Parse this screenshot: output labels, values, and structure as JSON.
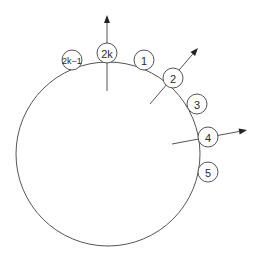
{
  "diagram": {
    "type": "ring-of-nodes",
    "ring": {
      "cx": 108,
      "cy": 154,
      "r": 92
    },
    "nodes": [
      {
        "id": "n2k1",
        "label": "2k−1",
        "cx": 72,
        "cy": 60,
        "r": 10,
        "font_size": 9
      },
      {
        "id": "n2k",
        "label": "2k",
        "cx": 107,
        "cy": 53,
        "r": 10,
        "font_size": 11
      },
      {
        "id": "n1",
        "label": "1",
        "cx": 144,
        "cy": 60,
        "r": 10,
        "font_size": 11
      },
      {
        "id": "n2",
        "label": "2",
        "cx": 173,
        "cy": 78,
        "r": 10,
        "font_size": 11
      },
      {
        "id": "n3",
        "label": "3",
        "cx": 197,
        "cy": 104,
        "r": 10,
        "font_size": 11
      },
      {
        "id": "n4",
        "label": "4",
        "cx": 208,
        "cy": 137,
        "r": 10,
        "font_size": 11
      },
      {
        "id": "n5",
        "label": "5",
        "cx": 208,
        "cy": 172,
        "r": 10,
        "font_size": 11
      }
    ],
    "arrows": [
      {
        "id": "arrow-2k",
        "from": [
          107,
          91
        ],
        "to": [
          107,
          15
        ]
      },
      {
        "id": "arrow-2",
        "from": [
          150,
          104
        ],
        "to": [
          198,
          48
        ]
      },
      {
        "id": "arrow-4",
        "from": [
          172,
          144
        ],
        "to": [
          247,
          130
        ]
      }
    ],
    "colors": {
      "stroke": "#555555",
      "arrowhead": "#222222",
      "background": "#ffffff"
    }
  }
}
